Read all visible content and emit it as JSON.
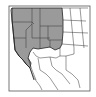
{
  "map": {
    "title": "Range map - western North America",
    "colors": {
      "range_fill": "#9a9a9a",
      "land_fill": "#ffffff",
      "border": "#222222",
      "frame": "#555555"
    },
    "range_regions": [
      "Washington",
      "Oregon",
      "Idaho",
      "Montana",
      "Wyoming",
      "California",
      "Nevada",
      "Utah",
      "Colorado (north)",
      "Arizona (north)",
      "New Mexico (north)"
    ],
    "unshaded_regions": [
      "North Dakota",
      "South Dakota",
      "Nebraska",
      "Kansas",
      "Oklahoma",
      "Texas",
      "Arizona (south)",
      "New Mexico (south)",
      "Baja California",
      "Sonora",
      "Chihuahua",
      "Coahuila"
    ]
  }
}
